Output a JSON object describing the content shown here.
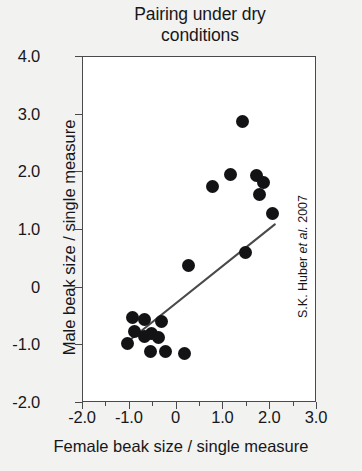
{
  "chart_data": {
    "type": "scatter",
    "title": "Pairing under dry conditions",
    "title_lines": [
      "Pairing under dry",
      "conditions"
    ],
    "xlabel": "Female beak size / single measure",
    "ylabel": "Male beak size / single measure",
    "xlim": [
      -2.0,
      3.0
    ],
    "ylim": [
      -2.0,
      4.0
    ],
    "xticks": [
      -2.0,
      -1.0,
      0,
      1.0,
      2.0,
      3.0
    ],
    "xticklabels": [
      "-2.0",
      "-1.0",
      "0",
      "1.0",
      "2.0",
      "3.0"
    ],
    "yticks": [
      -2.0,
      -1.0,
      0,
      1.0,
      2.0,
      3.0,
      4.0
    ],
    "yticklabels": [
      "-2.0",
      "-1.0",
      "0",
      "1.0",
      "2.0",
      "3.0",
      "4.0"
    ],
    "x_minor_ticks": [
      -1.5,
      -0.5,
      0.5,
      1.5,
      2.5
    ],
    "grid": false,
    "legend": false,
    "marker_color": "#131316",
    "line_color": "#4a4a4c",
    "frame_color": "#4a4a4c",
    "plot_background": "#ffffff",
    "figure_background": "#f2f2f0",
    "points": [
      {
        "x": 1.44,
        "y": 2.87
      },
      {
        "x": 0.78,
        "y": 1.73
      },
      {
        "x": 1.18,
        "y": 1.95
      },
      {
        "x": 1.72,
        "y": 1.92
      },
      {
        "x": 1.87,
        "y": 1.81
      },
      {
        "x": 1.8,
        "y": 1.6
      },
      {
        "x": 2.08,
        "y": 1.27
      },
      {
        "x": 1.5,
        "y": 0.6
      },
      {
        "x": 0.28,
        "y": 0.37
      },
      {
        "x": -0.93,
        "y": -0.54
      },
      {
        "x": -0.88,
        "y": -0.78
      },
      {
        "x": -1.03,
        "y": -0.99
      },
      {
        "x": -0.66,
        "y": -0.57
      },
      {
        "x": -0.31,
        "y": -0.6
      },
      {
        "x": -0.51,
        "y": -0.81
      },
      {
        "x": -0.66,
        "y": -0.86
      },
      {
        "x": -0.36,
        "y": -0.89
      },
      {
        "x": -0.54,
        "y": -1.12
      },
      {
        "x": -0.22,
        "y": -1.13
      },
      {
        "x": 0.2,
        "y": -1.16
      }
    ],
    "trendline": {
      "x_start": -0.97,
      "y_start": -0.92,
      "x_end": 2.12,
      "y_end": 1.08
    },
    "annotations": [
      {
        "name": "source-credit",
        "text_prefix": "S.K. Huber ",
        "text_italic": "et al.",
        "text_suffix": " 2007",
        "rotation": -90,
        "position": "right-outside"
      }
    ]
  }
}
